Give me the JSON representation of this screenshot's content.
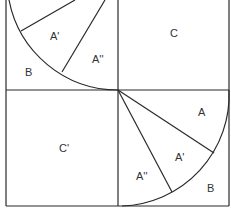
{
  "colors": {
    "stroke": "#2a2a2a",
    "text": "#333333",
    "background": "#ffffff"
  },
  "labels": {
    "top_left_A1": "A'",
    "top_left_A2": "A''",
    "top_left_B": "B",
    "top_right_C": "C",
    "bottom_left_C1": "C'",
    "bottom_right_A": "A",
    "bottom_right_A1": "A'",
    "bottom_right_A2": "A''",
    "bottom_right_B": "B"
  }
}
